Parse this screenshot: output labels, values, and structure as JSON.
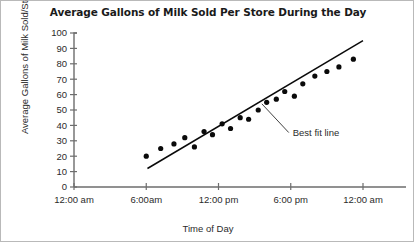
{
  "chart_data": {
    "type": "scatter",
    "title": "Average Gallons of Milk Sold Per Store During the Day",
    "xlabel": "Time of Day",
    "ylabel": "Average Gallons of Milk Sold/Store",
    "xlim": [
      0,
      24
    ],
    "ylim": [
      0,
      100
    ],
    "grid": false,
    "legend": "none",
    "ytick_labels": [
      "100",
      "90",
      "80",
      "70",
      "60",
      "50",
      "40",
      "30",
      "20",
      "10",
      "0"
    ],
    "ytick_values": [
      100,
      90,
      80,
      70,
      60,
      50,
      40,
      30,
      20,
      10,
      0
    ],
    "xtick_labels": [
      "12:00 am",
      "6:00am",
      "12:00 pm",
      "6:00 pm",
      "12:00 am"
    ],
    "xtick_values": [
      0,
      6,
      12,
      18,
      24
    ],
    "series": [
      {
        "name": "Average gallons sold",
        "marker": "filled-circle",
        "color": "#0a0a0a",
        "x": [
          6.0,
          7.2,
          8.3,
          9.2,
          10.0,
          10.8,
          11.5,
          12.3,
          13.0,
          13.8,
          14.5,
          15.3,
          16.0,
          16.8,
          17.5,
          18.3,
          19.0,
          20.0,
          21.0,
          22.0,
          23.2
        ],
        "y": [
          20,
          25,
          28,
          32,
          26,
          36,
          34,
          41,
          38,
          45,
          44,
          50,
          55,
          57,
          62,
          59,
          67,
          72,
          75,
          78,
          83
        ]
      }
    ],
    "trendline": {
      "label": "Best fit line",
      "color": "#0a0a0a",
      "x_start": 6.1,
      "y_start": 12,
      "x_end": 24.0,
      "y_end": 95
    },
    "annotations": [
      {
        "text": "Best fit line",
        "point_x": 15.6,
        "point_y": 54,
        "label_x": 18.0,
        "label_y": 36
      }
    ]
  }
}
